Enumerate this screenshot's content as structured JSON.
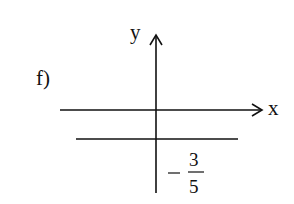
{
  "diagram": {
    "part_label": "f)",
    "x_axis_label": "x",
    "y_axis_label": "y",
    "line": {
      "equation": "y = -3/5",
      "type": "horizontal"
    },
    "intercept_label": {
      "sign": "−",
      "numerator": "3",
      "denominator": "5"
    }
  }
}
